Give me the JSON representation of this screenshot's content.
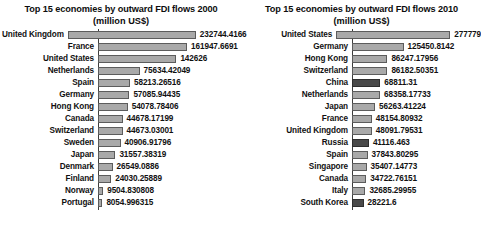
{
  "chart_data": [
    {
      "type": "bar",
      "orientation": "horizontal",
      "title": "Top 15 economies by outward FDI flows 2000",
      "subtitle": "(million US$)",
      "xlabel": "",
      "ylabel": "",
      "value_unit": "million US$",
      "axis_max": 280000,
      "grid": false,
      "legend": "none",
      "bar_color": "#a9a9a9",
      "bar_border_color": "#5c5c5c",
      "categories": [
        "United Kingdom",
        "France",
        "United States",
        "Netherlands",
        "Spain",
        "Germany",
        "Hong Kong",
        "Canada",
        "Switzerland",
        "Sweden",
        "Japan",
        "Denmark",
        "Finland",
        "Norway",
        "Portugal"
      ],
      "values": [
        232744.4166,
        161947.6691,
        142626,
        75634.42049,
        58213.26516,
        57085.94435,
        54078.78406,
        44678.17199,
        44673.03001,
        40906.91796,
        31557.38319,
        26549.0886,
        24030.25889,
        9504.830808,
        8054.996315
      ],
      "value_labels": [
        "232744.4166",
        "161947.6691",
        "142626",
        "75634.42049",
        "58213.26516",
        "57085.94435",
        "54078.78406",
        "44678.17199",
        "44673.03001",
        "40906.91796",
        "31557.38319",
        "26549.0886",
        "24030.25889",
        "9504.830808",
        "8054.996315"
      ],
      "highlighted": []
    },
    {
      "type": "bar",
      "orientation": "horizontal",
      "title": "Top 15 economies by outward FDI flows 2010",
      "subtitle": "(million US$)",
      "xlabel": "",
      "ylabel": "",
      "value_unit": "million US$",
      "axis_max": 280000,
      "grid": false,
      "legend": "none",
      "bar_color": "#a9a9a9",
      "bar_border_color": "#5c5c5c",
      "highlight_color": "#494949",
      "categories": [
        "United States",
        "Germany",
        "Hong Kong",
        "Switzerland",
        "China",
        "Netherlands",
        "Japan",
        "France",
        "United Kingdom",
        "Russia",
        "Spain",
        "Singapore",
        "Canada",
        "Italy",
        "South Korea"
      ],
      "values": [
        277779,
        125450.8142,
        86247.17956,
        86182.50351,
        68811.31,
        68358.17733,
        56263.41224,
        48154.80932,
        48091.79531,
        41116.463,
        37843.80295,
        35407.14773,
        34722.76151,
        32685.29955,
        28221.6
      ],
      "value_labels": [
        "277779",
        "125450.8142",
        "86247.17956",
        "86182.50351",
        "68811.31",
        "68358.17733",
        "56263.41224",
        "48154.80932",
        "48091.79531",
        "41116.463",
        "37843.80295",
        "35407.14773",
        "34722.76151",
        "32685.29955",
        "28221.6"
      ],
      "highlighted": [
        "China",
        "Russia",
        "South Korea"
      ]
    }
  ]
}
